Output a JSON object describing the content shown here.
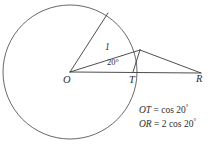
{
  "figure": {
    "vertices": {
      "O": {
        "label": "O",
        "x": 70,
        "y": 72,
        "role": "circle-center"
      },
      "T": {
        "label": "T",
        "x": 133,
        "y": 72,
        "role": "foot-of-perpendicular"
      },
      "R": {
        "label": "R",
        "x": 201,
        "y": 73,
        "role": "right-endpoint"
      },
      "P": {
        "label": "",
        "x": 140,
        "y": 50,
        "role": "apex-on-circle"
      },
      "A": {
        "label": "",
        "x": 108,
        "y": 13,
        "role": "upper-arc-point"
      }
    },
    "circle": {
      "center_x": 70,
      "center_y": 72,
      "radius": 67,
      "stroke_color": "#565656"
    },
    "labels": {
      "radius_length": "1",
      "angle": "20°"
    },
    "equations": [
      {
        "lhs": "OT",
        "relation": "=",
        "rhs_coefficient": "",
        "rhs_function": "cos",
        "rhs_angle": "20",
        "rhs_degree": "°"
      },
      {
        "lhs": "OR",
        "relation": "=",
        "rhs_coefficient": "2",
        "rhs_function": "cos",
        "rhs_angle": "20",
        "rhs_degree": "°"
      }
    ],
    "colors": {
      "line": "#3a3a3a",
      "circle": "#565656",
      "text": "#2e2e2e",
      "background": "#ffffff"
    }
  }
}
